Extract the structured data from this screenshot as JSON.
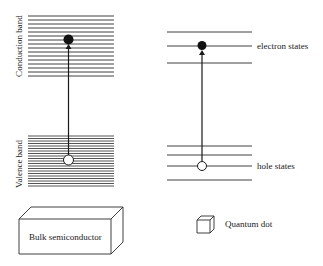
{
  "diagram": {
    "type": "energy-level-comparison",
    "bulk": {
      "conduction_band_label": "Conduction band",
      "valence_band_label": "Valence band",
      "object_label": "Bulk semiconductor",
      "conduction_lines": 16,
      "valence_lines": 21
    },
    "quantum_dot": {
      "electron_label": "electron states",
      "hole_label": "hole states",
      "object_label": "Quantum dot",
      "electron_levels": 3,
      "hole_levels": 4
    },
    "colors": {
      "line": "#2a2a2a",
      "text": "#1a1a1a",
      "background": "#ffffff"
    }
  }
}
